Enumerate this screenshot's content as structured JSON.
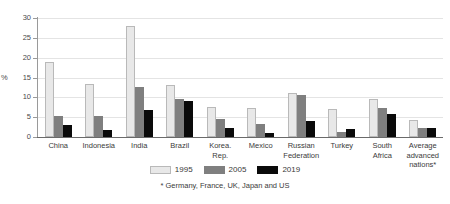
{
  "chart_data": {
    "type": "bar",
    "title": "",
    "xlabel": "",
    "ylabel": "%",
    "ylim": [
      0,
      30
    ],
    "yticks": [
      0,
      5,
      10,
      15,
      20,
      25,
      30
    ],
    "grid": true,
    "legend_position": "bottom",
    "categories": [
      "China",
      "Indonesia",
      "India",
      "Brazil",
      "Korea. Rep.",
      "Mexico",
      "Russian Federation",
      "Turkey",
      "South Africa",
      "Average advanced nations*"
    ],
    "category_lines": [
      [
        "China"
      ],
      [
        "Indonesia"
      ],
      [
        "India"
      ],
      [
        "Brazil"
      ],
      [
        "Korea.",
        "Rep."
      ],
      [
        "Mexico"
      ],
      [
        "Russian",
        "Federation"
      ],
      [
        "Turkey"
      ],
      [
        "South",
        "Africa"
      ],
      [
        "Average",
        "advanced",
        "nations*"
      ]
    ],
    "series": [
      {
        "name": "1995",
        "color": "#e8e8e8",
        "values": [
          19.0,
          13.3,
          28.0,
          13.0,
          7.5,
          7.3,
          11.0,
          7.0,
          9.5,
          4.2
        ]
      },
      {
        "name": "2005",
        "color": "#7f7f7f",
        "values": [
          5.4,
          5.4,
          12.7,
          9.5,
          4.6,
          3.3,
          10.7,
          1.2,
          7.4,
          2.3
        ]
      },
      {
        "name": "2019",
        "color": "#0a0a0a",
        "values": [
          3.0,
          1.8,
          6.7,
          9.2,
          2.2,
          1.1,
          4.0,
          1.9,
          5.8,
          2.3
        ]
      }
    ],
    "annotations": {
      "footnote": "* Germany, France, UK, Japan and US"
    }
  }
}
